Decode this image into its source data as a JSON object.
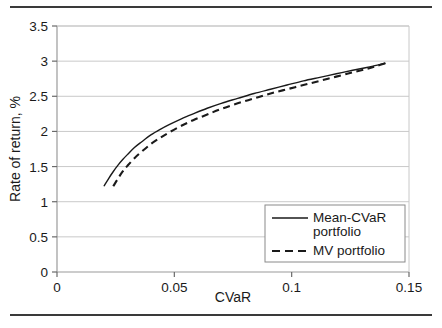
{
  "figure": {
    "top_rule": "horizontal-rule",
    "bottom_rule": "horizontal-rule"
  },
  "chart_data": {
    "type": "line",
    "title": "",
    "xlabel": "CVaR",
    "ylabel": "Rate of return, %",
    "xlim": [
      0,
      0.15
    ],
    "ylim": [
      0,
      3.5
    ],
    "xticks": [
      "0",
      "0.05",
      "0.1",
      "0.15"
    ],
    "xtick_values": [
      0,
      0.05,
      0.1,
      0.15
    ],
    "yticks": [
      "0",
      "0.5",
      "1",
      "1.5",
      "2",
      "2.5",
      "3",
      "3.5"
    ],
    "ytick_values": [
      0,
      0.5,
      1,
      1.5,
      2,
      2.5,
      3,
      3.5
    ],
    "grid": "horizontal",
    "legend_position": "lower-right",
    "series": [
      {
        "name": "Mean-CVaR portfolio",
        "style": "solid",
        "color": "#1a1a1a",
        "x": [
          0.02,
          0.022,
          0.024,
          0.026,
          0.028,
          0.03,
          0.033,
          0.036,
          0.04,
          0.044,
          0.048,
          0.053,
          0.058,
          0.064,
          0.07,
          0.077,
          0.084,
          0.091,
          0.098,
          0.105,
          0.112,
          0.119,
          0.126,
          0.132,
          0.136,
          0.14
        ],
        "y": [
          1.22,
          1.33,
          1.43,
          1.52,
          1.6,
          1.67,
          1.77,
          1.85,
          1.95,
          2.03,
          2.1,
          2.18,
          2.25,
          2.33,
          2.4,
          2.47,
          2.54,
          2.6,
          2.66,
          2.72,
          2.77,
          2.82,
          2.87,
          2.91,
          2.94,
          2.97
        ]
      },
      {
        "name": "MV portfolio",
        "style": "dashed",
        "color": "#1a1a1a",
        "x": [
          0.024,
          0.026,
          0.028,
          0.03,
          0.033,
          0.036,
          0.04,
          0.044,
          0.048,
          0.053,
          0.058,
          0.064,
          0.07,
          0.077,
          0.084,
          0.091,
          0.098,
          0.105,
          0.112,
          0.119,
          0.126,
          0.132,
          0.136,
          0.14
        ],
        "y": [
          1.22,
          1.33,
          1.43,
          1.51,
          1.62,
          1.71,
          1.82,
          1.91,
          1.99,
          2.08,
          2.16,
          2.24,
          2.32,
          2.4,
          2.47,
          2.54,
          2.6,
          2.66,
          2.72,
          2.78,
          2.84,
          2.89,
          2.93,
          2.97
        ]
      }
    ],
    "legend": [
      {
        "label_line1": "Mean-CVaR",
        "label_line2": "portfolio",
        "style": "solid"
      },
      {
        "label_line1": "MV portfolio",
        "label_line2": "",
        "style": "dashed"
      }
    ]
  }
}
